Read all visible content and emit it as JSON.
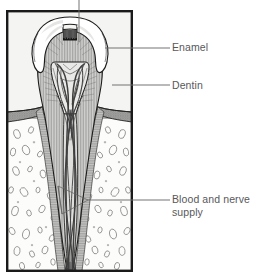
{
  "figure": {
    "frame": {
      "x": 6,
      "y": 10,
      "width": 127,
      "height": 262,
      "border_color": "#1a1a1a",
      "border_width": 2.5,
      "fill_color": "#f2f2f0"
    },
    "colors": {
      "outline": "#1a1a1a",
      "enamel_fill": "#ffffff",
      "dentin_fill": "#c9c9c7",
      "dentin_hatch": "#6e6e6e",
      "pulp_fill": "#e8e8e6",
      "bone_fill": "#fbfbfa",
      "bone_speckle": "#8d8d8b",
      "gum_fill": "#9a9a98",
      "periodontal_fill": "#bdbdbb",
      "vessel": "#4a4a4a",
      "leader_line": "#6b6b6d",
      "label_text": "#58585a",
      "occlusal_dark": "#141414"
    }
  },
  "labels": [
    {
      "id": "enamel",
      "text": "Enamel",
      "leader": {
        "x1": 105,
        "y1": 48,
        "x2": 170,
        "y2": 48
      },
      "text_x": 172,
      "text_y": 41
    },
    {
      "id": "dentin",
      "text": "Dentin",
      "leader": {
        "x1": 112,
        "y1": 85,
        "x2": 170,
        "y2": 85
      },
      "text_x": 172,
      "text_y": 79
    },
    {
      "id": "blood-nerve",
      "text": "Blood and nerve\nsupply",
      "line1": "Blood and nerve",
      "line2": "supply",
      "leader": {
        "x1": 88,
        "y1": 200,
        "x2": 170,
        "y2": 200
      },
      "text_x": 172,
      "text_y": 193
    }
  ],
  "callouts": {
    "top_leader": {
      "id": "crown-top-leader",
      "description": "leader line running off the top edge from the crown",
      "x": 79,
      "y1": 0,
      "y2": 42
    }
  },
  "structures": [
    {
      "id": "enamel",
      "name": "Enamel"
    },
    {
      "id": "dentin",
      "name": "Dentin"
    },
    {
      "id": "pulp",
      "name": "Pulp chamber"
    },
    {
      "id": "root-canal",
      "name": "Root canal"
    },
    {
      "id": "gum",
      "name": "Gum / gingiva"
    },
    {
      "id": "bone",
      "name": "Alveolar bone"
    },
    {
      "id": "blood-nerve",
      "name": "Blood and nerve supply"
    }
  ]
}
